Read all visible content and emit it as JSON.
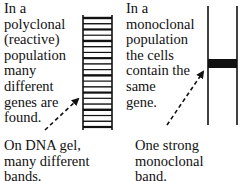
{
  "polyclonal": {
    "description": "In a\npolyclonal\n(reactive)\npopulation\nmany\ndifferent\ngenes are\nfound.",
    "caption": "On DNA gel,\nmany different\nbands.",
    "band_count": 20
  },
  "monoclonal": {
    "description": "In a\nmonoclonal\npopulation\nthe cells\ncontain the\nsame\ngene.",
    "caption": "One strong\nmonoclonal\nband.",
    "band_count": 1
  },
  "colors": {
    "ink": "#111111",
    "background": "#ffffff"
  }
}
